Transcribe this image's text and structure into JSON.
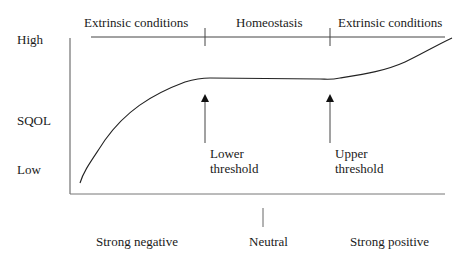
{
  "diagram": {
    "regions": [
      {
        "label": "Extrinsic conditions"
      },
      {
        "label": "Homeostasis"
      },
      {
        "label": "Extrinsic conditions"
      }
    ],
    "y_axis": {
      "title": "SQOL",
      "high_label": "High",
      "low_label": "Low"
    },
    "x_axis": {
      "labels": [
        "Strong negative",
        "Neutral",
        "Strong positive"
      ]
    },
    "thresholds": [
      {
        "line1": "Lower",
        "line2": "threshold"
      },
      {
        "line1": "Upper",
        "line2": "threshold"
      }
    ],
    "colors": {
      "line": "#333333",
      "text": "#1a1a1a",
      "background": "#ffffff"
    }
  }
}
